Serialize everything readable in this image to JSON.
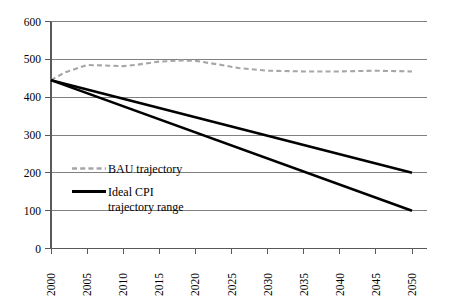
{
  "chart_data": {
    "type": "line",
    "title": "",
    "subtitle": "",
    "xlabel": "",
    "ylabel": "",
    "xlim": [
      2000,
      2050
    ],
    "ylim": [
      0,
      600
    ],
    "grid": true,
    "grid_axis": "y",
    "legend_position": "inside-lower-left",
    "x": [
      2000,
      2005,
      2010,
      2015,
      2020,
      2025,
      2030,
      2035,
      2040,
      2045,
      2050
    ],
    "x_tick_labels": [
      "2000",
      "2005",
      "2010",
      "2015",
      "2020",
      "2025",
      "2030",
      "2035",
      "2040",
      "2045",
      "2050"
    ],
    "x_tick_rotation": -90,
    "y_ticks": [
      0,
      100,
      200,
      300,
      400,
      500,
      600
    ],
    "y_tick_labels": [
      "0",
      "100",
      "200",
      "300",
      "400",
      "500",
      "600"
    ],
    "series": [
      {
        "name": "BAU trajectory",
        "style": "dashed",
        "color": "#a6a6a6",
        "x": [
          2000,
          2002,
          2005,
          2007,
          2010,
          2012,
          2015,
          2018,
          2020,
          2023,
          2026,
          2030,
          2035,
          2040,
          2045,
          2050
        ],
        "values": [
          445,
          466,
          485,
          484,
          482,
          486,
          494,
          497,
          496,
          487,
          477,
          470,
          468,
          468,
          470,
          468
        ]
      },
      {
        "name": "Ideal CPI trajectory range (upper)",
        "style": "solid",
        "color": "#000000",
        "x": [
          2000,
          2050
        ],
        "values": [
          445,
          200
        ]
      },
      {
        "name": "Ideal CPI trajectory range (lower)",
        "style": "solid",
        "color": "#000000",
        "x": [
          2000,
          2050
        ],
        "values": [
          445,
          100
        ]
      }
    ],
    "legend": [
      {
        "label": "BAU trajectory",
        "style": "dashed",
        "color": "#a6a6a6"
      },
      {
        "label": "Ideal CPI",
        "label2": "trajectory range",
        "style": "solid",
        "color": "#000000"
      }
    ],
    "colors": {
      "bau": "#a6a6a6",
      "cpi": "#000000",
      "gridline": "#808080",
      "axis": "#595959",
      "background": "#ffffff"
    }
  },
  "legend_text": {
    "bau": "BAU trajectory",
    "cpi_line1": "Ideal CPI",
    "cpi_line2": "trajectory range"
  },
  "axis_labels": {
    "y": {
      "t0": "0",
      "t100": "100",
      "t200": "200",
      "t300": "300",
      "t400": "400",
      "t500": "500",
      "t600": "600"
    },
    "x": {
      "y2000": "2000",
      "y2005": "2005",
      "y2010": "2010",
      "y2015": "2015",
      "y2020": "2020",
      "y2025": "2025",
      "y2030": "2030",
      "y2035": "2035",
      "y2040": "2040",
      "y2045": "2045",
      "y2050": "2050"
    }
  }
}
